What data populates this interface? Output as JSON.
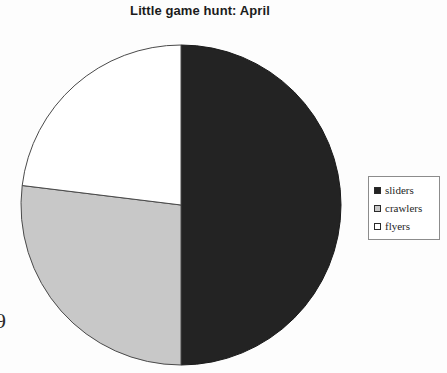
{
  "chart_data": {
    "type": "pie",
    "title": "Little game hunt: April",
    "categories": [
      "sliders",
      "crawlers",
      "flyers"
    ],
    "values": [
      50,
      27,
      23
    ],
    "units": "percent",
    "legend_position": "right",
    "grid": false,
    "start_angle_deg": 0,
    "direction": "clockwise",
    "slices": [
      {
        "label": "sliders",
        "value": 50,
        "color": "#232323",
        "edge_color": "#1a1a1a",
        "start_deg": 0,
        "end_deg": 180
      },
      {
        "label": "crawlers",
        "value": 27,
        "color": "#c8c8c8",
        "edge_color": "#4a4a4a",
        "start_deg": 180,
        "end_deg": 277
      },
      {
        "label": "flyers",
        "value": 23,
        "color": "#ffffff",
        "edge_color": "#4a4a4a",
        "start_deg": 277,
        "end_deg": 360
      }
    ],
    "geometry": {
      "center_x": 181,
      "center_y": 205,
      "radius": 160
    }
  },
  "legend": {
    "items": [
      {
        "label": "sliders",
        "swatch": "#232323"
      },
      {
        "label": "crawlers",
        "swatch": "#c8c8c8"
      },
      {
        "label": "flyers",
        "swatch": "#ffffff"
      }
    ]
  },
  "artifacts": {
    "page_mark": "9"
  }
}
